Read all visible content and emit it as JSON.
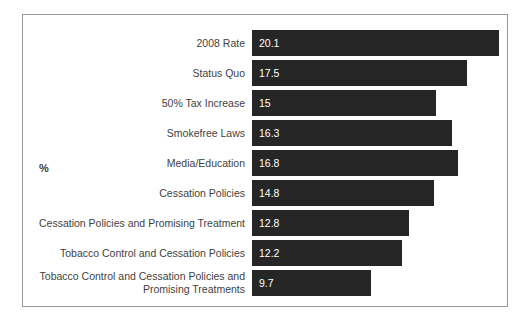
{
  "chart_data": {
    "type": "bar",
    "orientation": "horizontal",
    "title": "",
    "subtitle": "",
    "xlabel": "",
    "ylabel": "%",
    "grid": false,
    "legend": null,
    "xlim": [
      0,
      20.1
    ],
    "categories": [
      "2008 Rate",
      "Status Quo",
      "50% Tax Increase",
      "Smokefree Laws",
      "Media/Education",
      "Cessation Policies",
      "Cessation Policies and Promising Treatment",
      "Tobacco Control and Cessation Policies",
      "Tobacco Control and Cessation Policies and\nPromising Treatments"
    ],
    "values": [
      20.1,
      17.5,
      15,
      16.3,
      16.8,
      14.8,
      12.8,
      12.2,
      9.7
    ],
    "value_labels": [
      "20.1",
      "17.5",
      "15",
      "16.3",
      "16.8",
      "14.8",
      "12.8",
      "12.2",
      "9.7"
    ],
    "bar_color": "#262626",
    "value_label_color": "#ffffff",
    "category_label_color": "#3f3f3f",
    "frame_color": "#9a9a9a",
    "background_color": "#ffffff"
  },
  "rows": [
    {
      "label": "2008 Rate",
      "value": 20.1,
      "value_label": "20.1"
    },
    {
      "label": "Status Quo",
      "value": 17.5,
      "value_label": "17.5"
    },
    {
      "label": "50% Tax Increase",
      "value": 15,
      "value_label": "15"
    },
    {
      "label": "Smokefree Laws",
      "value": 16.3,
      "value_label": "16.3"
    },
    {
      "label": "Media/Education",
      "value": 16.8,
      "value_label": "16.8"
    },
    {
      "label": "Cessation Policies",
      "value": 14.8,
      "value_label": "14.8"
    },
    {
      "label": "Cessation Policies and Promising Treatment",
      "value": 12.8,
      "value_label": "12.8"
    },
    {
      "label": "Tobacco Control and Cessation Policies",
      "value": 12.2,
      "value_label": "12.2"
    },
    {
      "label": "Tobacco Control and Cessation Policies and\nPromising Treatments",
      "value": 9.7,
      "value_label": "9.7"
    }
  ],
  "axis": {
    "percent_label": "%"
  }
}
